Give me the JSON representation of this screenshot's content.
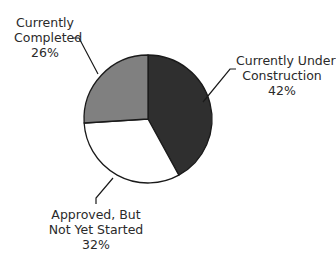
{
  "chart_data": {
    "type": "pie",
    "title": "",
    "categories": [
      "Currently Under Construction",
      "Approved, But Not Yet Started",
      "Currently Completed"
    ],
    "values": [
      42,
      32,
      26
    ],
    "unit": "%",
    "colors": [
      "#2f2f2f",
      "#ffffff",
      "#808080"
    ],
    "start_angle_deg": 0,
    "direction": "clockwise",
    "legend": "none",
    "labels": [
      {
        "line1": "Currently Under",
        "line2": "Construction",
        "pct": "42%"
      },
      {
        "line1": "Approved, But",
        "line2": "Not Yet Started",
        "pct": "32%"
      },
      {
        "line1": "Currently",
        "line2": "Completed",
        "pct": "26%"
      }
    ]
  }
}
